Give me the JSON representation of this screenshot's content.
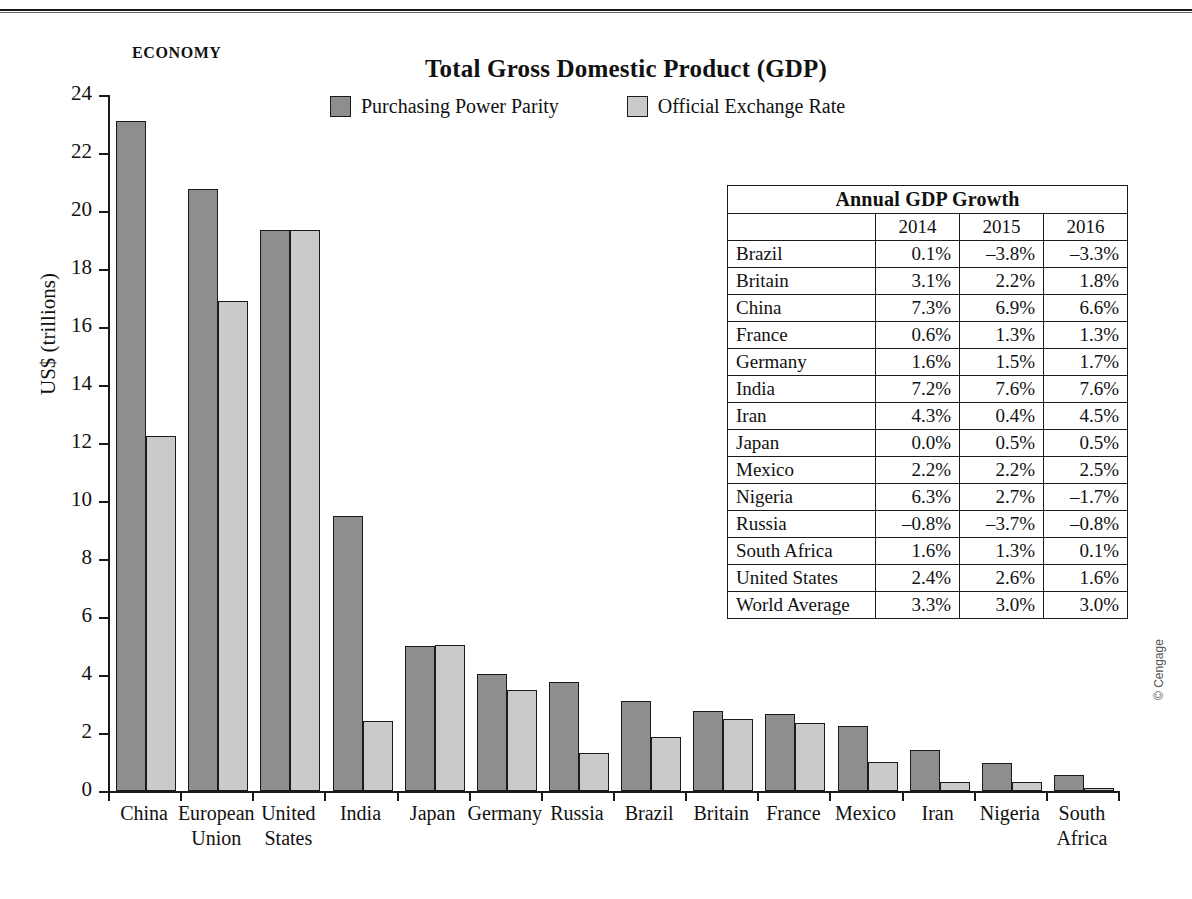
{
  "kicker": "ECONOMY",
  "credit": "© Cengage",
  "legend": {
    "ppp": "Purchasing Power Parity",
    "oer": "Official Exchange Rate",
    "ppp_color": "#8e8e8e",
    "oer_color": "#cacaca"
  },
  "table": {
    "title": "Annual GDP Growth",
    "corner": "",
    "columns": [
      "2014",
      "2015",
      "2016"
    ],
    "rows": [
      {
        "name": "Brazil",
        "values": [
          "0.1%",
          "–3.8%",
          "–3.3%"
        ]
      },
      {
        "name": "Britain",
        "values": [
          "3.1%",
          "2.2%",
          "1.8%"
        ]
      },
      {
        "name": "China",
        "values": [
          "7.3%",
          "6.9%",
          "6.6%"
        ]
      },
      {
        "name": "France",
        "values": [
          "0.6%",
          "1.3%",
          "1.3%"
        ]
      },
      {
        "name": "Germany",
        "values": [
          "1.6%",
          "1.5%",
          "1.7%"
        ]
      },
      {
        "name": "India",
        "values": [
          "7.2%",
          "7.6%",
          "7.6%"
        ]
      },
      {
        "name": "Iran",
        "values": [
          "4.3%",
          "0.4%",
          "4.5%"
        ]
      },
      {
        "name": "Japan",
        "values": [
          "0.0%",
          "0.5%",
          "0.5%"
        ]
      },
      {
        "name": "Mexico",
        "values": [
          "2.2%",
          "2.2%",
          "2.5%"
        ]
      },
      {
        "name": "Nigeria",
        "values": [
          "6.3%",
          "2.7%",
          "–1.7%"
        ]
      },
      {
        "name": "Russia",
        "values": [
          "–0.8%",
          "–3.7%",
          "–0.8%"
        ]
      },
      {
        "name": "South Africa",
        "values": [
          "1.6%",
          "1.3%",
          "0.1%"
        ]
      },
      {
        "name": "United States",
        "values": [
          "2.4%",
          "2.6%",
          "1.6%"
        ]
      },
      {
        "name": "World Average",
        "values": [
          "3.3%",
          "3.0%",
          "3.0%"
        ]
      }
    ]
  },
  "chart_data": {
    "type": "bar",
    "title": "Total Gross Domestic Product (GDP)",
    "xlabel": "",
    "ylabel": "US$ (trillions)",
    "ylim": [
      0,
      24
    ],
    "ytick_step": 2,
    "yticks": [
      "0",
      "2",
      "4",
      "6",
      "8",
      "10",
      "12",
      "14",
      "16",
      "18",
      "20",
      "22",
      "24"
    ],
    "grid": false,
    "legend_position": "top-center",
    "categories": [
      "China",
      "European Union",
      "United States",
      "India",
      "Japan",
      "Germany",
      "Russia",
      "Brazil",
      "Britain",
      "France",
      "Mexico",
      "Iran",
      "Nigeria",
      "South Africa"
    ],
    "category_lines": [
      [
        "China"
      ],
      [
        "European",
        "Union"
      ],
      [
        "United",
        "States"
      ],
      [
        "India"
      ],
      [
        "Japan"
      ],
      [
        "Germany"
      ],
      [
        "Russia"
      ],
      [
        "Brazil"
      ],
      [
        "Britain"
      ],
      [
        "France"
      ],
      [
        "Mexico"
      ],
      [
        "Iran"
      ],
      [
        "Nigeria"
      ],
      [
        "South",
        "Africa"
      ]
    ],
    "series": [
      {
        "name": "Purchasing Power Parity",
        "color": "#8e8e8e",
        "values": [
          23.1,
          20.75,
          19.35,
          9.5,
          5.0,
          4.05,
          3.75,
          3.1,
          2.75,
          2.65,
          2.25,
          1.4,
          0.95,
          0.55
        ]
      },
      {
        "name": "Official Exchange Rate",
        "color": "#cacaca",
        "values": [
          12.25,
          16.9,
          19.35,
          2.4,
          5.05,
          3.5,
          1.3,
          1.85,
          2.5,
          2.35,
          1.0,
          0.3,
          0.3,
          0.1
        ]
      }
    ]
  }
}
